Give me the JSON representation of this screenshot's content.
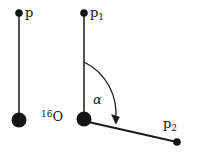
{
  "figure": {
    "kind": "momentum-vector-diagram",
    "background_color": "#ffffff",
    "stroke_color": "#1a1a1a",
    "text_color": "#121212",
    "width": 198,
    "height": 156
  },
  "labels": {
    "incident_momentum": "p",
    "outgoing_momentum_1_base": "p",
    "outgoing_momentum_1_sub": "1",
    "outgoing_momentum_2_base": "p",
    "outgoing_momentum_2_sub": "2",
    "nucleus_mass_number": "16",
    "nucleus_symbol": "O",
    "scattering_angle": "α"
  },
  "geometry": {
    "left_panel": {
      "vector_p": {
        "tail_x": 19,
        "tail_y": 120,
        "head_x": 19,
        "head_y": 14
      },
      "nucleus_dot": {
        "cx": 19,
        "cy": 120,
        "r": 7.5
      },
      "tip_dot": {
        "cx": 19,
        "cy": 13,
        "r": 3.8
      }
    },
    "right_panel": {
      "vertex_dot": {
        "cx": 84,
        "cy": 119,
        "r": 7.5
      },
      "vector_p1": {
        "tail_x": 84,
        "tail_y": 119,
        "head_x": 84,
        "head_y": 14
      },
      "p1_tip_dot": {
        "cx": 84,
        "cy": 13,
        "r": 3.8
      },
      "vector_p2": {
        "tail_x": 84,
        "tail_y": 121,
        "head_x": 177,
        "head_y": 142
      },
      "p2_tip_dot": {
        "cx": 177,
        "cy": 142,
        "r": 3.8
      },
      "angle_arc": {
        "start_x": 84,
        "start_y": 62,
        "end_x": 116,
        "end_y": 122,
        "radius": 57,
        "sweep": "clockwise",
        "arrowhead": "end"
      }
    }
  }
}
